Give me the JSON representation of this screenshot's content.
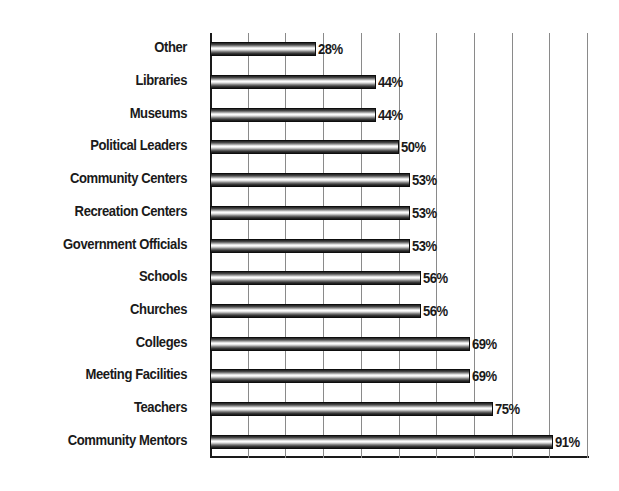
{
  "chart_data": {
    "type": "bar",
    "orientation": "horizontal",
    "title": "",
    "xlabel": "",
    "ylabel": "",
    "xlim": [
      0,
      100
    ],
    "grid": true,
    "grid_axis": "x",
    "gridline_step": 10,
    "legend": "none",
    "value_suffix": "%",
    "categories": [
      "Other",
      "Libraries",
      "Museums",
      "Political Leaders",
      "Community Centers",
      "Recreation Centers",
      "Government Officials",
      "Schools",
      "Churches",
      "Colleges",
      "Meeting Facilities",
      "Teachers",
      "Community Mentors"
    ],
    "values": [
      28,
      44,
      44,
      50,
      53,
      53,
      53,
      56,
      56,
      69,
      69,
      75,
      91
    ],
    "value_labels": [
      "28%",
      "44%",
      "44%",
      "50%",
      "53%",
      "53%",
      "53%",
      "56%",
      "56%",
      "69%",
      "69%",
      "75%",
      "91%"
    ],
    "tick_values": [
      0,
      10,
      20,
      30,
      40,
      50,
      60,
      70,
      80,
      90,
      100
    ],
    "tick_labels": [
      "",
      "",
      "",
      "",
      "",
      "",
      "",
      "",
      "",
      "",
      ""
    ],
    "colors": {
      "bar_outline": "#0d0d0d",
      "bar_highlight": "#ffffff",
      "bar_shadow": "#141414",
      "gridline": "#8a8a8a",
      "axis": "#1a1a1a",
      "text": "#1a1a1a",
      "background": "#ffffff"
    }
  }
}
